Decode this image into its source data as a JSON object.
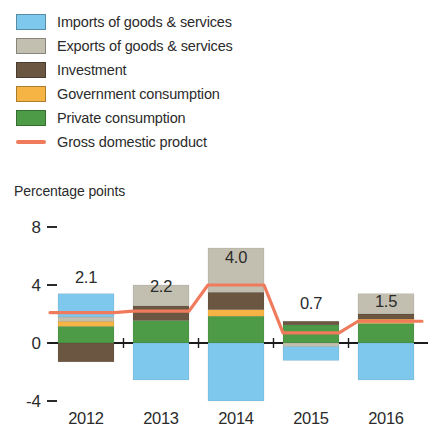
{
  "legend": {
    "items": [
      {
        "label": "Imports of goods & services",
        "key": "imports",
        "color": "#7ec8ee",
        "marker": "swatch",
        "icon": "legend-swatch-imports"
      },
      {
        "label": "Exports of goods & services",
        "key": "exports",
        "color": "#c3bfb0",
        "marker": "swatch",
        "icon": "legend-swatch-exports"
      },
      {
        "label": "Investment",
        "key": "investment",
        "color": "#6b5642",
        "marker": "swatch",
        "icon": "legend-swatch-investment"
      },
      {
        "label": "Government consumption",
        "key": "government",
        "color": "#f6b košt",
        "marker": "swatch",
        "icon": "legend-swatch-government"
      },
      {
        "label": "Private consumption",
        "key": "private",
        "color": "#4e9b47",
        "marker": "swatch",
        "icon": "legend-swatch-private"
      },
      {
        "label": "Gross domestic product",
        "key": "gdp",
        "color": "#f07b5c",
        "marker": "line",
        "icon": "legend-line-gdp"
      }
    ]
  },
  "chart_data": {
    "type": "bar",
    "title": "",
    "subtitle": "",
    "ylabel": "Percentage points",
    "xlabel": "",
    "categories": [
      "2012",
      "2013",
      "2014",
      "2015",
      "2016"
    ],
    "ylim": [
      -4,
      8
    ],
    "yticks": [
      -4,
      0,
      4,
      8
    ],
    "ytick_labels": [
      "-4",
      "0",
      "4",
      "8"
    ],
    "grid": false,
    "legend_position": "top-left",
    "stacked": true,
    "series": [
      {
        "name": "Private consumption",
        "key": "private",
        "color": "#4e9b47",
        "values": [
          1.15,
          1.55,
          1.85,
          1.25,
          1.35
        ]
      },
      {
        "name": "Government consumption",
        "key": "government",
        "color": "#f6b444",
        "values": [
          0.35,
          0.0,
          0.45,
          0.0,
          0.3
        ]
      },
      {
        "name": "Investment",
        "key": "investment",
        "color": "#6b5642",
        "values": [
          -1.3,
          1.0,
          1.2,
          0.25,
          0.35
        ]
      },
      {
        "name": "Exports of goods & services",
        "key": "exports",
        "color": "#c3bfb0",
        "values": [
          0.3,
          1.45,
          3.05,
          -0.25,
          1.4
        ]
      },
      {
        "name": "Imports of goods & services",
        "key": "imports",
        "color": "#7ec8ee",
        "values": [
          1.6,
          -2.55,
          -4.0,
          -0.95,
          -2.55
        ]
      }
    ],
    "line_series": {
      "name": "Gross domestic product",
      "key": "gdp",
      "color": "#f07b5c",
      "values": [
        2.1,
        2.2,
        4.0,
        0.7,
        1.5
      ]
    },
    "value_labels": [
      "2.1",
      "2.2",
      "4.0",
      "0.7",
      "1.5"
    ]
  }
}
